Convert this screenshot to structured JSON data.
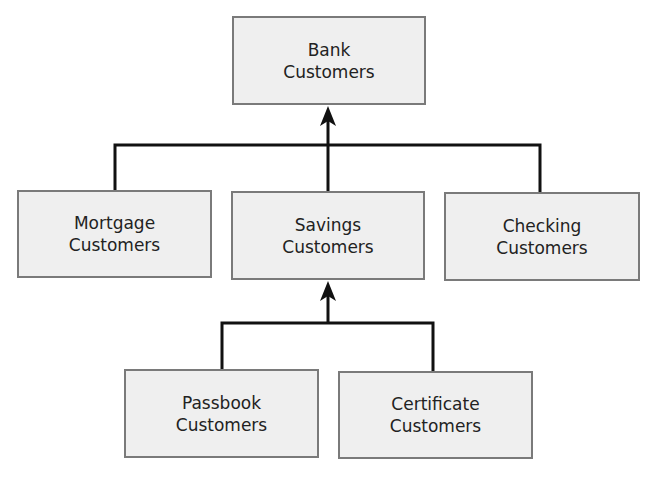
{
  "diagram": {
    "type": "hierarchy",
    "nodes": {
      "bank": {
        "line1": "Bank",
        "line2": "Customers"
      },
      "mortgage": {
        "line1": "Mortgage",
        "line2": "Customers"
      },
      "savings": {
        "line1": "Savings",
        "line2": "Customers"
      },
      "checking": {
        "line1": "Checking",
        "line2": "Customers"
      },
      "passbook": {
        "line1": "Passbook",
        "line2": "Customers"
      },
      "certificate": {
        "line1": "Certificate",
        "line2": "Customers"
      }
    },
    "edges": [
      {
        "from": "mortgage",
        "to": "bank"
      },
      {
        "from": "savings",
        "to": "bank"
      },
      {
        "from": "checking",
        "to": "bank"
      },
      {
        "from": "passbook",
        "to": "savings"
      },
      {
        "from": "certificate",
        "to": "savings"
      }
    ],
    "colors": {
      "box_fill": "#efefef",
      "box_border": "#7a7a7a",
      "line": "#111111"
    }
  }
}
